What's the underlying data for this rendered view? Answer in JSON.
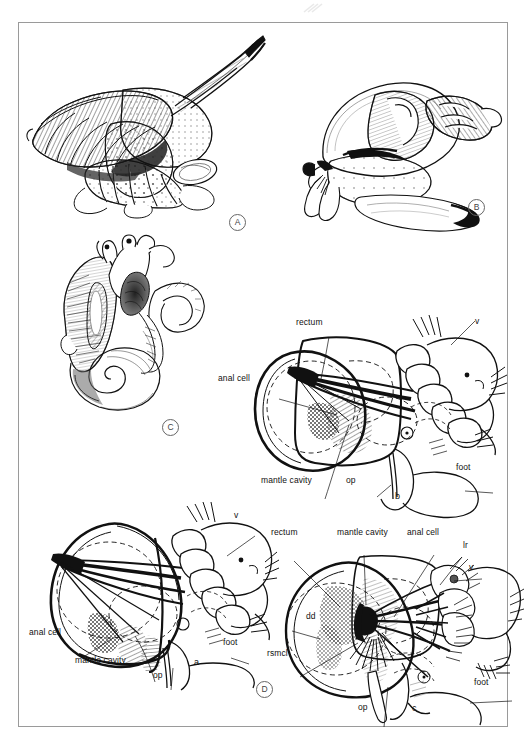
{
  "figure": {
    "type": "scientific-illustration-plate",
    "panel_markers": [
      "A",
      "B",
      "C",
      "D"
    ],
    "frame_color": "#9a9a9a",
    "ink_color": "#111111"
  },
  "panels": {
    "A": {
      "marker": "A",
      "caption": "",
      "subject": "whole living gastropod crawling, shell with long siphon extended"
    },
    "B": {
      "marker": "B",
      "caption": "",
      "subject": "gastropod with broad foot and dorsal shell, lateral view"
    },
    "C": {
      "marker": "C",
      "caption": "",
      "subject": "dissected gastropod showing coiled visceral mass, gill and tentacles"
    },
    "D": {
      "marker": "D",
      "caption": "",
      "subject": "three schematic diagrams a, b, c of mantle cavity organisation"
    }
  },
  "diagrams": [
    {
      "id": "b",
      "sublabel": "b",
      "labels": [
        {
          "text": "rectum",
          "name": "rectum"
        },
        {
          "text": "anal cell",
          "name": "anal-cell"
        },
        {
          "text": "mantle cavity",
          "name": "mantle-cavity"
        },
        {
          "text": "op",
          "name": "operculum"
        },
        {
          "text": "foot",
          "name": "foot"
        },
        {
          "text": "v",
          "name": "velum"
        }
      ]
    },
    {
      "id": "a",
      "sublabel": "a",
      "labels": [
        {
          "text": "anal cell",
          "name": "anal-cell"
        },
        {
          "text": "mantle cavity",
          "name": "mantle-cavity"
        },
        {
          "text": "op",
          "name": "operculum"
        },
        {
          "text": "foot",
          "name": "foot"
        },
        {
          "text": "v",
          "name": "velum"
        }
      ]
    },
    {
      "id": "c",
      "sublabel": "c",
      "labels": [
        {
          "text": "rectum",
          "name": "rectum"
        },
        {
          "text": "mantle cavity",
          "name": "mantle-cavity"
        },
        {
          "text": "anal cell",
          "name": "anal-cell"
        },
        {
          "text": "lr",
          "name": "left-ridge"
        },
        {
          "text": "v",
          "name": "velum"
        },
        {
          "text": "dd",
          "name": "digestive-diverticulum"
        },
        {
          "text": "rsmcl",
          "name": "retractor-shell-muscle"
        },
        {
          "text": "op",
          "name": "operculum"
        },
        {
          "text": "foot",
          "name": "foot"
        }
      ]
    }
  ],
  "label_text": {
    "rectum": "rectum",
    "anal_cell": "anal cell",
    "mantle_cavity": "mantle cavity",
    "op": "op",
    "foot": "foot",
    "v": "v",
    "lr": "lr",
    "dd": "dd",
    "rsmcl": "rsmcl",
    "a": "a",
    "b": "b",
    "c": "c",
    "A": "A",
    "B": "B",
    "C": "C",
    "D": "D"
  }
}
